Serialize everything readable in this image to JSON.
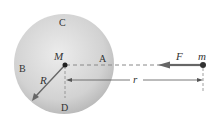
{
  "diagram": {
    "sphere": {
      "center_label": "M",
      "radius_label": "R",
      "points": {
        "top": "C",
        "left": "B",
        "right": "A",
        "bottom": "D"
      }
    },
    "particle": {
      "label": "m"
    },
    "force": {
      "label": "F"
    },
    "distance": {
      "label": "r"
    }
  },
  "colors": {
    "sphere_light": "#ececec",
    "sphere_dark": "#b0b0b0",
    "line": "#555555",
    "dashed": "#888888"
  }
}
